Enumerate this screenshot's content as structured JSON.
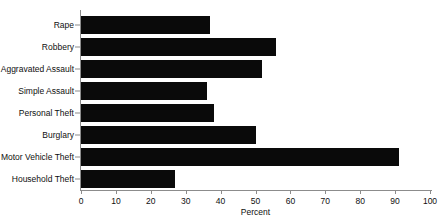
{
  "chart_data": {
    "type": "bar",
    "orientation": "horizontal",
    "title": "",
    "xlabel": "Percent",
    "ylabel": "",
    "xlim": [
      0,
      100
    ],
    "xticks": [
      0,
      10,
      20,
      30,
      40,
      50,
      60,
      70,
      80,
      90,
      100
    ],
    "grid": false,
    "legend": null,
    "bar_color": "#0a0a0a",
    "axis_color": "#8c8c8c",
    "categories": [
      "Rape",
      "Robbery",
      "Aggravated Assault",
      "Simple Assault",
      "Personal Theft",
      "Burglary",
      "Motor Vehicle Theft",
      "Household Theft"
    ],
    "values": [
      37,
      56,
      52,
      36,
      38,
      50,
      91,
      27
    ]
  }
}
